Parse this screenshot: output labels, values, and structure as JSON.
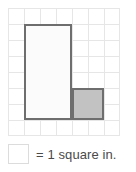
{
  "figure": {
    "title": "",
    "grid": {
      "columns": 7,
      "rows": 8,
      "cell_size_px": 16,
      "line_color": "#e6e6e6"
    },
    "shape": {
      "name": "L-shaped figure",
      "outline_color": "#6e6e6e",
      "parts": [
        {
          "name": "tall-rectangle",
          "width_units": 3,
          "height_units": 6,
          "fill": "#fbfbfb",
          "shaded": false
        },
        {
          "name": "unit-square",
          "width_units": 2,
          "height_units": 2,
          "fill": "#c2c2c2",
          "shaded": true
        }
      ]
    }
  },
  "legend": {
    "swatch_name": "unit-square-swatch",
    "swatch_fill": "#ffffff",
    "swatch_border": "#dcdcdc",
    "text": "= 1 square in."
  }
}
